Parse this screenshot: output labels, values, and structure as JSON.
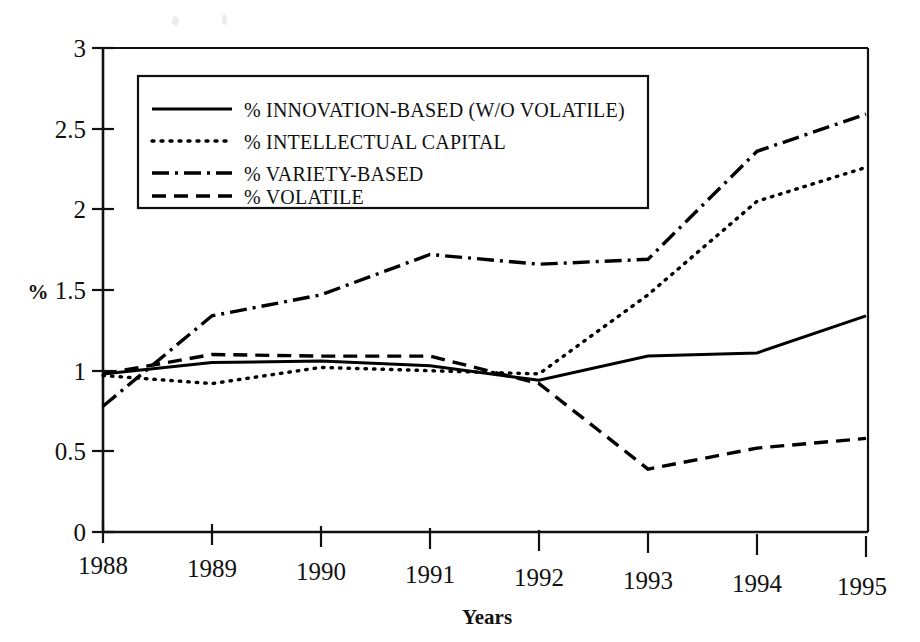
{
  "chart_data": {
    "type": "line",
    "title": "",
    "subtitle": "",
    "xlabel": "Years",
    "ylabel": "%",
    "x": [
      1988,
      1989,
      1990,
      1991,
      1992,
      1993,
      1994,
      1995
    ],
    "categories": [
      "1988",
      "1989",
      "1990",
      "1991",
      "1992",
      "1993",
      "1994",
      "1995"
    ],
    "xlim": [
      1988,
      1995
    ],
    "ylim": [
      0,
      3
    ],
    "yticks": [
      0,
      0.5,
      1,
      1.5,
      2,
      2.5,
      3
    ],
    "ytick_labels": [
      "0",
      "0.5",
      "1",
      "1.5",
      "2",
      "2.5",
      "3"
    ],
    "grid": false,
    "legend_position": "upper-left",
    "series": [
      {
        "name": "% INNOVATION-BASED (W/O VOLATILE)",
        "style": "solid",
        "color": "#000000",
        "values": [
          0.98,
          1.05,
          1.06,
          1.03,
          0.94,
          1.09,
          1.11,
          1.34
        ]
      },
      {
        "name": "% INTELLECTUAL CAPITAL",
        "style": "dotted",
        "color": "#000000",
        "values": [
          0.97,
          0.92,
          1.02,
          1.0,
          0.98,
          1.47,
          2.05,
          2.26
        ]
      },
      {
        "name": "% VARIETY-BASED",
        "style": "dashdot",
        "color": "#000000",
        "values": [
          0.78,
          1.34,
          1.47,
          1.72,
          1.66,
          1.69,
          2.36,
          2.59
        ]
      },
      {
        "name": "% VOLATILE",
        "style": "dashed",
        "color": "#000000",
        "values": [
          0.98,
          1.1,
          1.09,
          1.09,
          0.92,
          0.39,
          0.52,
          0.58
        ]
      }
    ]
  },
  "legend": {
    "items": [
      {
        "label": "% INNOVATION-BASED (W/O VOLATILE)",
        "style": "solid"
      },
      {
        "label": "% INTELLECTUAL CAPITAL",
        "style": "dotted"
      },
      {
        "label": "% VARIETY-BASED",
        "style": "dashdot"
      },
      {
        "label": "% VOLATILE",
        "style": "dashed"
      }
    ]
  },
  "axes": {
    "y_label": "%",
    "x_label": "Years",
    "y_ticks": [
      "3",
      "2.5",
      "2",
      "1.5",
      "1",
      "0.5",
      "0"
    ],
    "x_ticks": [
      "1988",
      "1989",
      "1990",
      "1991",
      "1992",
      "1993",
      "1994",
      "1995"
    ]
  }
}
